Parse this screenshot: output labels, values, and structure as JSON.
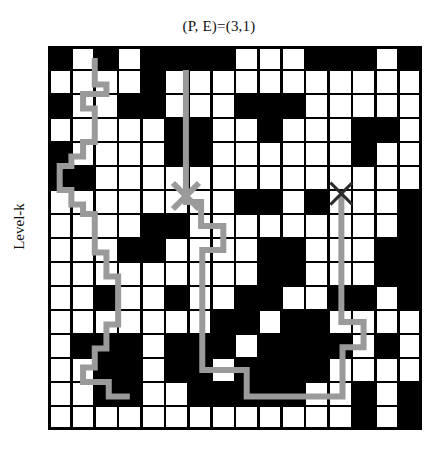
{
  "figure": {
    "title": "(P, E)=(3,1)",
    "ylabel": "Level-k",
    "background": "#ffffff"
  },
  "chart_data": {
    "type": "heatmap",
    "title": "(P, E)=(3,1)",
    "xlabel": "",
    "ylabel": "Level-k",
    "grid": true,
    "legend_position": "none",
    "rows": 16,
    "cols": 16,
    "cell_size_px": 23.375,
    "value_map": {
      "0": "white",
      "1": "black"
    },
    "colors": {
      "blocked": "#000000",
      "free": "#ffffff",
      "gridline": "#000000",
      "path": "#9a9a9a",
      "marker_start": "#9a9a9a",
      "marker_goal": "#2b2b2b"
    },
    "matrix": [
      [
        1,
        0,
        1,
        0,
        1,
        1,
        1,
        1,
        0,
        0,
        0,
        1,
        1,
        1,
        0,
        1
      ],
      [
        0,
        0,
        0,
        0,
        1,
        0,
        0,
        0,
        0,
        0,
        0,
        0,
        0,
        0,
        0,
        0
      ],
      [
        1,
        0,
        0,
        1,
        1,
        0,
        0,
        0,
        1,
        1,
        1,
        0,
        0,
        0,
        0,
        0
      ],
      [
        0,
        0,
        0,
        0,
        0,
        1,
        1,
        0,
        0,
        1,
        0,
        0,
        0,
        1,
        1,
        0
      ],
      [
        1,
        0,
        0,
        0,
        0,
        1,
        1,
        0,
        0,
        0,
        0,
        0,
        0,
        1,
        0,
        0
      ],
      [
        1,
        1,
        0,
        0,
        0,
        0,
        0,
        0,
        0,
        0,
        0,
        0,
        0,
        0,
        0,
        0
      ],
      [
        0,
        0,
        0,
        0,
        0,
        0,
        0,
        0,
        1,
        1,
        0,
        1,
        0,
        0,
        0,
        1
      ],
      [
        0,
        0,
        0,
        0,
        1,
        1,
        0,
        0,
        0,
        0,
        0,
        0,
        0,
        0,
        0,
        1
      ],
      [
        0,
        0,
        0,
        1,
        1,
        0,
        0,
        0,
        0,
        1,
        1,
        0,
        0,
        0,
        1,
        1
      ],
      [
        0,
        0,
        0,
        0,
        0,
        0,
        0,
        0,
        0,
        1,
        1,
        0,
        0,
        0,
        1,
        1
      ],
      [
        0,
        0,
        1,
        0,
        0,
        1,
        0,
        0,
        1,
        1,
        0,
        0,
        1,
        1,
        0,
        1
      ],
      [
        0,
        0,
        0,
        0,
        0,
        0,
        0,
        1,
        1,
        0,
        1,
        1,
        0,
        0,
        0,
        0
      ],
      [
        0,
        1,
        1,
        1,
        0,
        1,
        1,
        1,
        0,
        1,
        1,
        1,
        1,
        0,
        1,
        0
      ],
      [
        0,
        0,
        1,
        1,
        0,
        1,
        1,
        0,
        1,
        1,
        1,
        1,
        0,
        0,
        0,
        0
      ],
      [
        0,
        0,
        1,
        1,
        0,
        0,
        1,
        1,
        1,
        1,
        1,
        0,
        0,
        1,
        0,
        1
      ],
      [
        0,
        0,
        0,
        0,
        0,
        0,
        0,
        0,
        0,
        0,
        0,
        0,
        0,
        1,
        0,
        1
      ]
    ],
    "markers": [
      {
        "name": "start-marker",
        "glyph": "x",
        "col": 5.9,
        "row": 6.25,
        "color": "#9a9a9a",
        "size": 26
      },
      {
        "name": "goal-marker",
        "glyph": "x",
        "col": 12.55,
        "row": 6.15,
        "color": "#2b2b2b",
        "size": 22
      }
    ],
    "path": {
      "name": "solution-path",
      "color": "#9a9a9a",
      "width_px": 6,
      "points_rc": [
        [
          2.0,
          0.5
        ],
        [
          2.0,
          1.6
        ],
        [
          2.5,
          1.6
        ],
        [
          2.5,
          2.0
        ],
        [
          1.5,
          2.0
        ],
        [
          1.5,
          2.6
        ],
        [
          2.0,
          2.6
        ],
        [
          2.0,
          4.0
        ],
        [
          1.5,
          4.0
        ],
        [
          1.5,
          4.6
        ],
        [
          1.0,
          4.6
        ],
        [
          1.0,
          5.0
        ],
        [
          0.5,
          5.0
        ],
        [
          0.5,
          6.0
        ],
        [
          1.0,
          6.0
        ],
        [
          1.0,
          6.6
        ],
        [
          1.5,
          6.6
        ],
        [
          1.5,
          7.0
        ],
        [
          2.0,
          7.0
        ],
        [
          2.0,
          8.6
        ],
        [
          2.5,
          8.6
        ],
        [
          2.5,
          9.6
        ],
        [
          3.0,
          9.6
        ],
        [
          3.0,
          11.6
        ],
        [
          2.5,
          11.6
        ],
        [
          2.5,
          12.6
        ],
        [
          2.0,
          12.6
        ],
        [
          2.0,
          13.4
        ],
        [
          1.5,
          13.4
        ],
        [
          1.5,
          14.0
        ],
        [
          2.6,
          14.0
        ],
        [
          2.6,
          14.6
        ],
        [
          3.5,
          14.6
        ]
      ],
      "secondary_rc": [
        [
          5.9,
          1.0
        ],
        [
          5.9,
          6.25
        ],
        [
          5.9,
          6.5
        ],
        [
          6.55,
          6.5
        ],
        [
          6.55,
          7.5
        ],
        [
          7.5,
          7.5
        ],
        [
          7.5,
          8.5
        ],
        [
          6.6,
          8.5
        ],
        [
          6.6,
          13.5
        ],
        [
          8.5,
          13.5
        ],
        [
          8.5,
          14.6
        ],
        [
          12.6,
          14.6
        ],
        [
          12.6,
          12.55
        ],
        [
          13.5,
          12.55
        ],
        [
          13.5,
          11.5
        ],
        [
          12.55,
          11.5
        ],
        [
          12.55,
          6.2
        ]
      ]
    }
  }
}
